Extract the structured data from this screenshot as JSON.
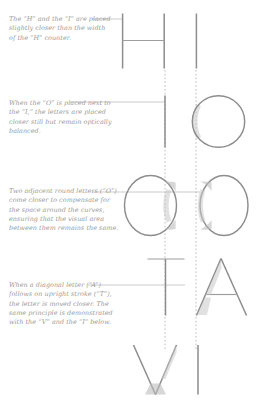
{
  "page": {
    "background_color": "#ffffff",
    "ink_color": "#8d8d8d",
    "caption_color": "#9a9a9a",
    "guide_color": "#b0b0b0"
  },
  "captions": [
    {
      "id": "caption-h-i",
      "text": "The “H” and the “I” are placed slightly closer than the width of the “H” counter."
    },
    {
      "id": "caption-o-i",
      "text": "When the “O” is placed next to the “I,” the letters are placed closer still but remain optically balanced."
    },
    {
      "id": "caption-o-o",
      "text": "Two adjacent round letters (“O”) come closer to compensate for the space around the curves, ensuring that the visual area between them remains the same."
    },
    {
      "id": "caption-t-a",
      "text": "When a diagonal letter (“A”) follows on upright stroke (“T”), the letter is moved closer. The same principle is demonstrated with the “V” and the “I” below."
    }
  ],
  "specimens": [
    {
      "id": "row-h-i",
      "letters": [
        "H",
        "I"
      ]
    },
    {
      "id": "row-i-o",
      "letters": [
        "I",
        "O"
      ]
    },
    {
      "id": "row-o-o",
      "letters": [
        "O",
        "O"
      ]
    },
    {
      "id": "row-t-a",
      "letters": [
        "T",
        "A"
      ]
    },
    {
      "id": "row-v-i",
      "letters": [
        "V",
        "I"
      ]
    }
  ],
  "guides": {
    "label": "vertical dashed alignment guides",
    "count": 2
  }
}
